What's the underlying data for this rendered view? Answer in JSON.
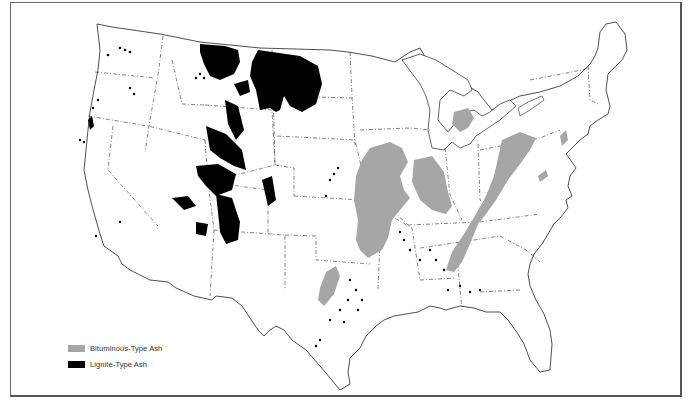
{
  "map": {
    "subject": "United States coal ash types",
    "colors": {
      "bituminous": "#a6a6a6",
      "lignite": "#000000",
      "border": "#222222",
      "frame": "#6a6a6a"
    }
  },
  "legend": {
    "items": [
      {
        "label": "Bituminous-Type Ash",
        "color": "#a6a6a6"
      },
      {
        "label": "Lignite-Type Ash",
        "color": "#000000"
      }
    ]
  }
}
